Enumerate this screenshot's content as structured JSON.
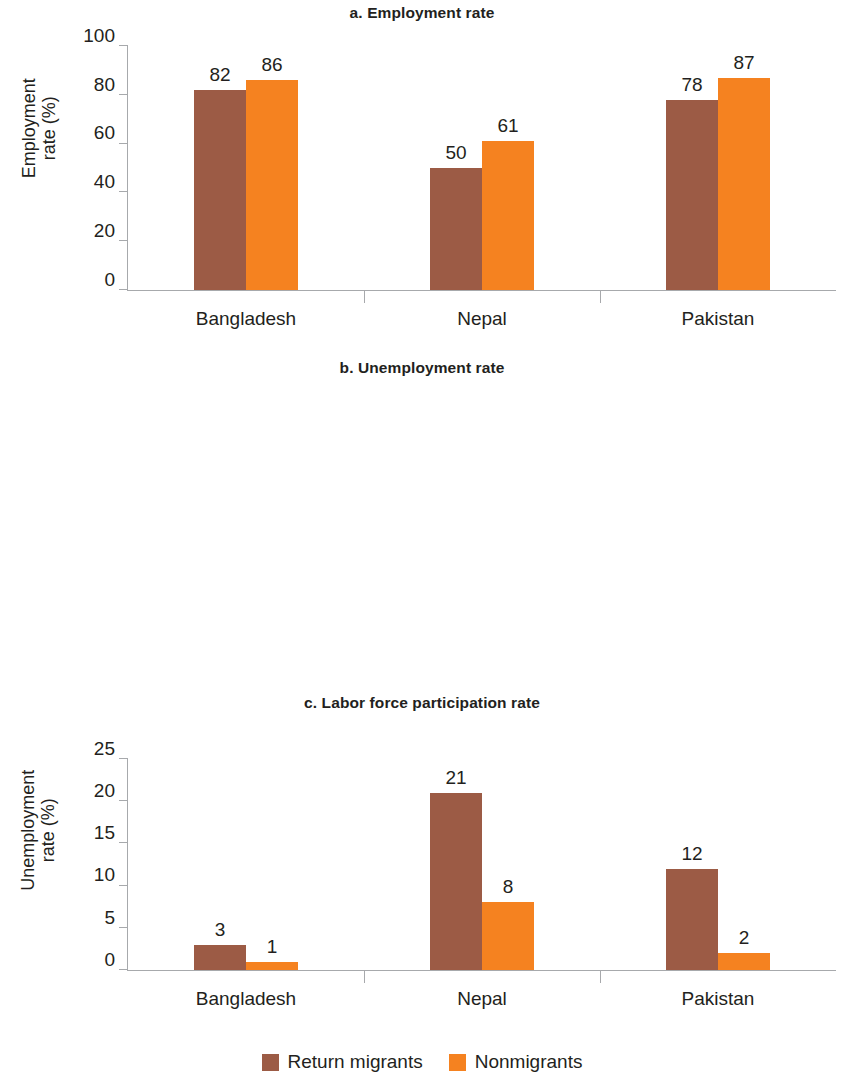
{
  "figure": {
    "series_colors": {
      "return_migrants": "#9C5B45",
      "nonmigrants": "#F58220"
    },
    "axis_color": "#a7a9ac"
  },
  "legend": {
    "items": [
      {
        "label": "Return migrants",
        "color": "#9C5B45",
        "swatch_name": "legend-swatch-return-migrants"
      },
      {
        "label": "Nonmigrants",
        "color": "#F58220",
        "swatch_name": "legend-swatch-nonmigrants"
      }
    ]
  },
  "chart_data": [
    {
      "type": "bar",
      "title": "a. Employment rate",
      "xlabel": "",
      "ylabel": "Employment\nrate (%)",
      "categories": [
        "Bangladesh",
        "Nepal",
        "Pakistan"
      ],
      "ylim": [
        0,
        100
      ],
      "yticks": [
        0,
        20,
        40,
        60,
        80,
        100
      ],
      "ytick_labels": [
        "0",
        "20",
        "40",
        "60",
        "80",
        "100"
      ],
      "grid": false,
      "legend_position": "bottom",
      "series": [
        {
          "name": "Return migrants",
          "color": "#9C5B45",
          "values": [
            82,
            50,
            78
          ]
        },
        {
          "name": "Nonmigrants",
          "color": "#F58220",
          "values": [
            86,
            61,
            87
          ]
        }
      ]
    },
    {
      "type": "bar",
      "title": "b. Unemployment rate",
      "xlabel": "",
      "ylabel": "Unemployment\nrate (%)",
      "categories": [
        "Bangladesh",
        "Nepal",
        "Pakistan"
      ],
      "ylim": [
        0,
        25
      ],
      "yticks": [
        0,
        5,
        10,
        15,
        20,
        25
      ],
      "ytick_labels": [
        "0",
        "5",
        "10",
        "15",
        "20",
        "25"
      ],
      "grid": false,
      "legend_position": "bottom",
      "series": [
        {
          "name": "Return migrants",
          "color": "#9C5B45",
          "values": [
            3,
            21,
            12
          ]
        },
        {
          "name": "Nonmigrants",
          "color": "#F58220",
          "values": [
            1,
            8,
            2
          ]
        }
      ]
    },
    {
      "type": "bar",
      "title": "c. Labor force participation rate",
      "xlabel": "",
      "ylabel": "Labor force participation\nrate (%)",
      "categories": [
        "Bangladesh",
        "Nepal",
        "Pakistan"
      ],
      "ylim": [
        0,
        100
      ],
      "yticks": [
        0,
        20,
        40,
        60,
        80,
        100
      ],
      "ytick_labels": [
        "0",
        "20",
        "40",
        "60",
        "80",
        "100"
      ],
      "grid": false,
      "legend_position": "bottom",
      "series": [
        {
          "name": "Return migrants",
          "color": "#9C5B45",
          "values": [
            83,
            63,
            89
          ]
        },
        {
          "name": "Nonmigrants",
          "color": "#F58220",
          "values": [
            88,
            67,
            89
          ]
        }
      ]
    }
  ]
}
